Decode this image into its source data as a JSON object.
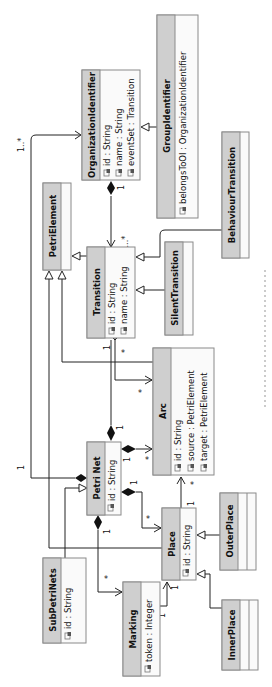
{
  "diagram": {
    "type": "uml-class-diagram",
    "orientation": "rotated-90-ccw",
    "classes": [
      {
        "id": "oi",
        "name": "OrganizationIdentifier",
        "attributes": [
          "id : String",
          "name : String",
          "eventSet : Transition"
        ]
      },
      {
        "id": "gi",
        "name": "GroupIdentifier",
        "attributes": [
          "belongsToOI : OrganizationIdentifier"
        ]
      },
      {
        "id": "pe",
        "name": "PetriElement",
        "attributes": []
      },
      {
        "id": "tr",
        "name": "Transition",
        "attributes": [
          "id : String",
          "name : String"
        ]
      },
      {
        "id": "st",
        "name": "SilentTransition",
        "attributes": []
      },
      {
        "id": "bt",
        "name": "BehaviourTransition",
        "attributes": []
      },
      {
        "id": "arc",
        "name": "Arc",
        "attributes": [
          "id : String",
          "source : PetriElement",
          "target : PetriElement"
        ]
      },
      {
        "id": "pn",
        "name": "Petri Net",
        "attributes": [
          "id : String"
        ]
      },
      {
        "id": "pl",
        "name": "Place",
        "attributes": [
          "id : String"
        ]
      },
      {
        "id": "op",
        "name": "OuterPlace",
        "attributes": []
      },
      {
        "id": "ip",
        "name": "InnerPlace",
        "attributes": []
      },
      {
        "id": "mk",
        "name": "Marking",
        "attributes": [
          "token : Integer"
        ]
      },
      {
        "id": "sp",
        "name": "SubPetriNets",
        "attributes": [
          "id : String"
        ]
      }
    ],
    "relations": [
      {
        "from": "GroupIdentifier",
        "to": "OrganizationIdentifier",
        "kind": "generalization"
      },
      {
        "from": "OrganizationIdentifier",
        "to": "Transition",
        "kind": "composition",
        "src_mult": "1",
        "tgt_mult": "1..*"
      },
      {
        "from": "Transition",
        "to": "PetriElement",
        "kind": "generalization"
      },
      {
        "from": "SilentTransition",
        "to": "Transition",
        "kind": "generalization"
      },
      {
        "from": "BehaviourTransition",
        "to": "Transition",
        "kind": "generalization"
      },
      {
        "from": "Place",
        "to": "PetriElement",
        "kind": "generalization"
      },
      {
        "from": "Arc",
        "to": "PetriElement",
        "kind": "generalization"
      },
      {
        "from": "Transition",
        "to": "Arc",
        "kind": "association",
        "src_mult": "1",
        "tgt_mult": "*"
      },
      {
        "from": "Petri Net",
        "to": "Transition",
        "kind": "composition",
        "src_mult": "1",
        "tgt_mult": "*"
      },
      {
        "from": "Petri Net",
        "to": "Arc",
        "kind": "composition",
        "src_mult": "1",
        "tgt_mult": "*"
      },
      {
        "from": "Petri Net",
        "to": "Place",
        "kind": "composition",
        "src_mult": "1",
        "tgt_mult": "*"
      },
      {
        "from": "Petri Net",
        "to": "Marking",
        "kind": "composition",
        "src_mult": "1",
        "tgt_mult": "*"
      },
      {
        "from": "Petri Net",
        "to": "OrganizationIdentifier",
        "kind": "composition",
        "src_mult": "1",
        "tgt_mult": "1..*"
      },
      {
        "from": "Place",
        "to": "Arc",
        "kind": "association",
        "src_mult": "1",
        "tgt_mult": "*"
      },
      {
        "from": "Marking",
        "to": "Place",
        "kind": "association",
        "src_mult": "1",
        "tgt_mult": "1"
      },
      {
        "from": "SubPetriNets",
        "to": "Petri Net",
        "kind": "generalization"
      },
      {
        "from": "OuterPlace",
        "to": "Place",
        "kind": "generalization"
      },
      {
        "from": "InnerPlace",
        "to": "Place",
        "kind": "generalization"
      }
    ],
    "multiplicities": {
      "oi_tr_src": "1",
      "oi_tr_tgt": "1..*",
      "pn_oi_src": "1",
      "pn_oi_tgt": "1..*",
      "tr_arc_src": "1",
      "tr_arc_tgt": "*",
      "pn_tr_src": "1",
      "pn_arc_src": "1",
      "pn_arc_tgt": "*",
      "pn_pl_src": "1",
      "pn_pl_tgt": "*",
      "pl_arc_src": "1",
      "pl_arc_tgt": "*",
      "pn_mk_src": "1",
      "pn_mk_tgt": "*",
      "mk_pl_src": "1",
      "mk_pl_tgt": "1",
      "pn_tr_tgt": "*"
    }
  }
}
